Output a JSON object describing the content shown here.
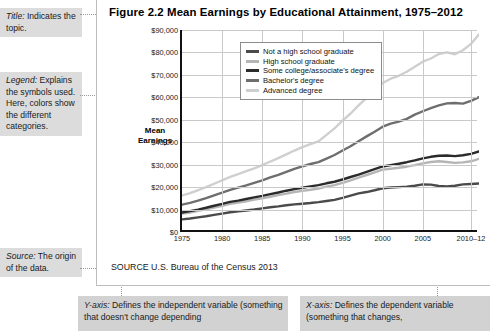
{
  "annotations": {
    "title_note": "Title: Indicates the topic.",
    "title_note_lead": "Title:",
    "title_note_rest": " Indicates the topic.",
    "legend_note_lead": "Legend:",
    "legend_note_rest": " Explains the symbols used. Here, colors show the different categories.",
    "source_note_lead": "Source:",
    "source_note_rest": " The origin of the data.",
    "yaxis_note_lead": "Y-axis:",
    "yaxis_note_rest": " Defines the independent variable (something that doesn't change depending",
    "xaxis_note_lead": "X-axis:",
    "xaxis_note_rest": " Defines the dependent variable (something that changes,"
  },
  "figure": {
    "title": "Figure 2.2  Mean Earnings by Educational Attainment, 1975–2012",
    "source": "SOURCE  U.S. Bureau of the Census 2013"
  },
  "chart_data": {
    "type": "line",
    "title": "Figure 2.2  Mean Earnings by Educational Attainment, 1975–2012",
    "xlabel": "",
    "ylabel": "Mean Earnings",
    "ylim": [
      0,
      90000
    ],
    "xlim": [
      1975,
      2012
    ],
    "grid": true,
    "legend_position": "top-left-inside",
    "ytick_labels": [
      "$0",
      "$10,000",
      "$20,000",
      "$30,000",
      "$40,000",
      "$50,000",
      "$60,000",
      "$70,000",
      "$80,000",
      "$90,000"
    ],
    "ytick_values": [
      0,
      10000,
      20000,
      30000,
      40000,
      50000,
      60000,
      70000,
      80000,
      90000
    ],
    "xtick_labels": [
      "1975",
      "1980",
      "1985",
      "1990",
      "1995",
      "2000",
      "2005",
      "2010–12"
    ],
    "xtick_values": [
      1975,
      1980,
      1985,
      1990,
      1995,
      2000,
      2005,
      2011
    ],
    "x": [
      1975,
      1976,
      1977,
      1978,
      1979,
      1980,
      1981,
      1982,
      1983,
      1984,
      1985,
      1986,
      1987,
      1988,
      1989,
      1990,
      1991,
      1992,
      1993,
      1994,
      1995,
      1996,
      1997,
      1998,
      1999,
      2000,
      2001,
      2002,
      2003,
      2004,
      2005,
      2006,
      2007,
      2008,
      2009,
      2010,
      2011,
      2012
    ],
    "series": [
      {
        "name": "Not a high school graduate",
        "color": "#4a4a4a",
        "values": [
          5600,
          6000,
          6500,
          7000,
          7600,
          8200,
          8800,
          9200,
          9600,
          10000,
          10500,
          11000,
          11400,
          11900,
          12300,
          12600,
          12900,
          13300,
          13800,
          14300,
          15200,
          16200,
          17200,
          17800,
          18600,
          19500,
          19800,
          20000,
          20200,
          20600,
          21200,
          21100,
          20500,
          20300,
          20600,
          21200,
          21400,
          21600
        ]
      },
      {
        "name": "High school graduate",
        "color": "#b5b5b5",
        "values": [
          8200,
          8700,
          9400,
          10100,
          10900,
          11700,
          12500,
          13100,
          13700,
          14400,
          15000,
          15700,
          16400,
          17100,
          17800,
          18300,
          18800,
          19400,
          20200,
          20900,
          21900,
          23000,
          24200,
          25400,
          26600,
          27800,
          28200,
          28600,
          29100,
          29800,
          30600,
          31200,
          31500,
          31200,
          30800,
          31000,
          31500,
          32600
        ]
      },
      {
        "name": "Some college/associate's degree",
        "color": "#2b2b2b",
        "values": [
          8700,
          9300,
          10000,
          10800,
          11700,
          12500,
          13400,
          14000,
          14700,
          15400,
          16100,
          16900,
          17600,
          18400,
          19100,
          19700,
          20300,
          20900,
          21700,
          22400,
          23400,
          24500,
          25600,
          26800,
          28000,
          29200,
          29800,
          30400,
          31100,
          31900,
          32800,
          33500,
          34000,
          34100,
          33800,
          34200,
          34800,
          35900
        ]
      },
      {
        "name": "Bachelor's degree",
        "color": "#6e6e6e",
        "values": [
          12200,
          13000,
          14000,
          15100,
          16300,
          17500,
          18800,
          19800,
          20800,
          21900,
          23000,
          24300,
          25500,
          26800,
          28100,
          29200,
          30300,
          31100,
          32700,
          34300,
          36300,
          38200,
          40400,
          42600,
          44700,
          46900,
          48300,
          49200,
          50400,
          52300,
          53800,
          55200,
          56400,
          57300,
          57500,
          57200,
          58400,
          60100
        ]
      },
      {
        "name": "Advanced degree",
        "color": "#cfcfcf",
        "values": [
          16300,
          17300,
          18600,
          20000,
          21500,
          23000,
          24600,
          25800,
          27100,
          28400,
          29800,
          31400,
          32900,
          34600,
          36300,
          37800,
          39200,
          40400,
          43300,
          46200,
          49600,
          52800,
          56400,
          59800,
          63100,
          66400,
          68300,
          69600,
          71400,
          73600,
          75900,
          77300,
          79300,
          80000,
          79200,
          81000,
          83800,
          88100
        ]
      }
    ]
  }
}
